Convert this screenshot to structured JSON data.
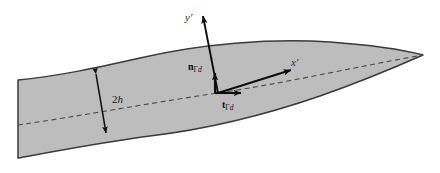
{
  "figure": {
    "name": "tapered-domain-diagram",
    "caption_text": "",
    "colors": {
      "background": "#ffffff",
      "body_fill": "#bdbdbd",
      "body_stroke": "#3b3b3b",
      "centerline": "#555555",
      "vector": "#0d0d0d",
      "dimension": "#111111"
    },
    "labels": {
      "y_axis": "y",
      "y_axis_prime": "′",
      "x_axis": "x",
      "x_axis_prime": "′",
      "thickness": "2",
      "thickness_symbol": "h",
      "normal_vector": "n",
      "normal_subscript_gamma": "Γ",
      "normal_subscript_d": "d",
      "tangent_vector": "t",
      "tangent_subscript_gamma": "Γ",
      "tangent_subscript_d": "d"
    },
    "geometry": {
      "left_edge_x": 18,
      "left_top_y": 80,
      "left_bottom_y": 158,
      "tip_x": 423,
      "tip_y": 55,
      "origin_x": 218,
      "origin_y": 93,
      "y_axis_tip_x": 202,
      "y_axis_tip_y": 13,
      "x_axis_tip_x": 295,
      "x_axis_tip_y": 69,
      "normal_tip_x": 214,
      "normal_tip_y": 70,
      "tangent_tip_x": 244,
      "tangent_tip_y": 93,
      "dim_top_x": 95,
      "dim_top_y": 71,
      "dim_bottom_x": 107,
      "dim_bottom_y": 136
    }
  }
}
